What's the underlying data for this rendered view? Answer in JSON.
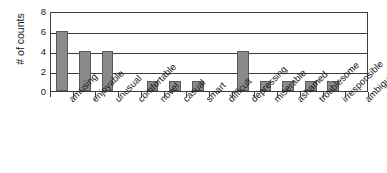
{
  "chart_data": {
    "type": "bar",
    "title": "",
    "subtitle": "",
    "xlabel": "",
    "ylabel": "# of counts",
    "ylim": [
      0,
      8
    ],
    "yticks": [
      0,
      2,
      4,
      6,
      8
    ],
    "ytick_labels": [
      "0",
      "2",
      "4",
      "6",
      "8"
    ],
    "grid": "horizontal",
    "legend": "none",
    "categories": [
      "amusing",
      "enjoyable",
      "unusual",
      "comfortable",
      "novel",
      "casual",
      "smart",
      "difficult",
      "depressing",
      "miserable",
      "ashamed",
      "troublesome",
      "irresponsible",
      "ambiguous"
    ],
    "values": [
      6,
      4,
      4,
      0,
      1,
      1,
      1,
      0,
      4,
      1,
      1,
      1,
      1,
      0
    ],
    "bar_color": "#8a8a8a",
    "bar_edge_color": "#5a5a5a",
    "axis_color": "#3d3d3d",
    "background_color": "#ffffff",
    "text_color": "#1a1a1a"
  }
}
